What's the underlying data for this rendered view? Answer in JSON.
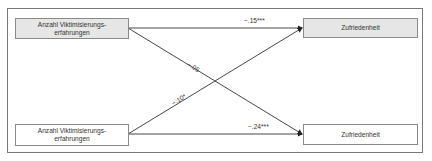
{
  "diagram": {
    "type": "path-model",
    "nodes": [
      {
        "id": "pred_t1",
        "lines": [
          "Anzahl Viktimisierungs-",
          "erfahrungen"
        ],
        "shaded": true
      },
      {
        "id": "out_t1",
        "lines": [
          "Zufriedenheit"
        ],
        "shaded": true
      },
      {
        "id": "pred_t2",
        "lines": [
          "Anzahl Viktimisierungs-",
          "erfahrungen"
        ],
        "shaded": false
      },
      {
        "id": "out_t2",
        "lines": [
          "Zufriedenheit"
        ],
        "shaded": false
      }
    ],
    "edges": [
      {
        "from": "pred_t1",
        "to": "out_t1",
        "label": "−.15***"
      },
      {
        "from": "pred_t1",
        "to": "out_t2",
        "label": "−.05"
      },
      {
        "from": "pred_t2",
        "to": "out_t1",
        "label": "−.10*"
      },
      {
        "from": "pred_t2",
        "to": "out_t2",
        "label": "−.24***"
      }
    ]
  },
  "colors": {
    "shaded_fill": "#e6e6e6",
    "border": "#8a8a8a",
    "line": "#333333"
  }
}
